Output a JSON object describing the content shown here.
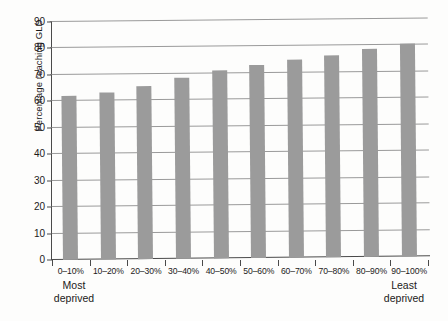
{
  "chart_data": {
    "type": "bar",
    "title": "",
    "subtitle": "",
    "xlabel": "",
    "ylabel": "Percentage reaching GLD",
    "categories": [
      "0–10%",
      "10–20%",
      "20–30%",
      "30–40%",
      "40–50%",
      "50–60%",
      "60–70%",
      "70–80%",
      "80–90%",
      "90–100%"
    ],
    "values": [
      62,
      63,
      65.5,
      68.5,
      71,
      73,
      75,
      76.5,
      78.5,
      80.5
    ],
    "ylim": [
      0,
      90
    ],
    "yticks": [
      0,
      10,
      20,
      30,
      40,
      50,
      60,
      70,
      80,
      90
    ],
    "ytick_labels": [
      "0",
      "10",
      "20",
      "30",
      "40",
      "50",
      "60",
      "70",
      "80",
      "90"
    ],
    "grid": true,
    "grid_axis": "y",
    "legend": false,
    "legend_position": "none",
    "bar_color": "#9b9b9b",
    "axis_color": "#4a4a4a",
    "gridline_color": "#9a9a9a",
    "annotations": [
      {
        "name": "most-deprived",
        "text": "Most deprived",
        "line1": "Most",
        "line2": "deprived",
        "anchor": "0–10%"
      },
      {
        "name": "least-deprived",
        "text": "Least deprived",
        "line1": "Least",
        "line2": "deprived",
        "anchor": "90–100%"
      }
    ]
  }
}
